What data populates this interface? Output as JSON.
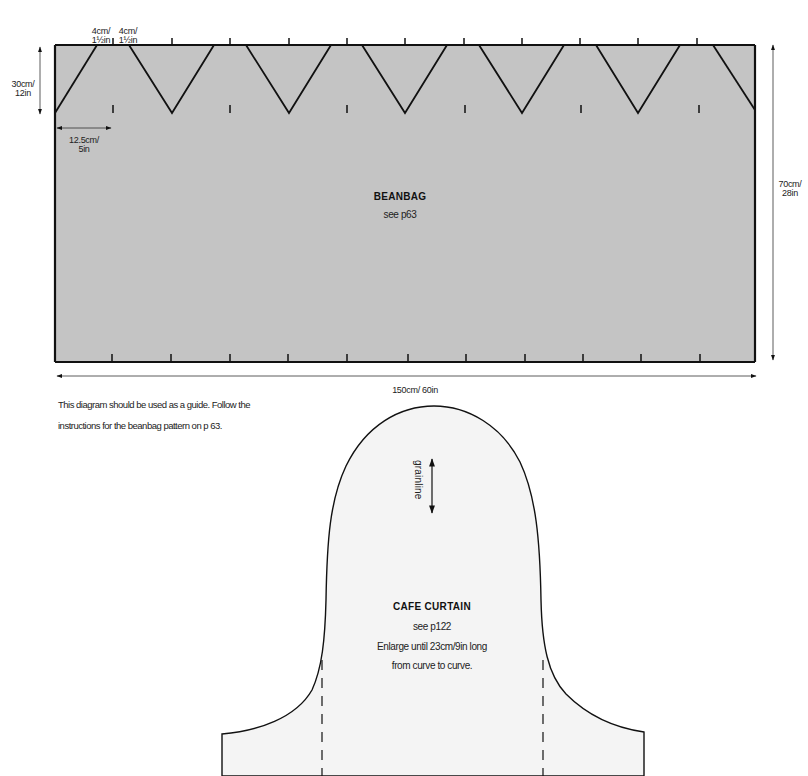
{
  "beanbag": {
    "title": "BEANBAG",
    "reference": "see p63",
    "fill_color": "#c4c4c4",
    "dimensions": {
      "triangle_side_a": "4cm/\n1½in",
      "triangle_side_b": "4cm/\n1½in",
      "flap_height": "30cm/\n12in",
      "point_spacing": "12.5cm/\n5in",
      "height": "70cm/\n28in",
      "width": "150cm/ 60in"
    },
    "labels": {
      "tri_a_line1": "4cm/",
      "tri_a_line2": "1½in",
      "tri_b_line1": "4cm/",
      "tri_b_line2": "1½in",
      "flap_line1": "30cm/",
      "flap_line2": "12in",
      "spacing_line1": "12.5cm/",
      "spacing_line2": "5in",
      "height_line1": "70cm/",
      "height_line2": "28in",
      "width": "150cm/ 60in"
    },
    "note_line1": "This diagram should be used as a guide. Follow the",
    "note_line2": "instructions for the beanbag pattern on p 63."
  },
  "cafe_curtain": {
    "title": "CAFE CURTAIN",
    "reference": "see p122",
    "instruction_line1": "Enlarge until 23cm/9in long",
    "instruction_line2": "from curve to curve.",
    "grainline_label": "grainline",
    "fill_color": "#f4f4f4"
  }
}
